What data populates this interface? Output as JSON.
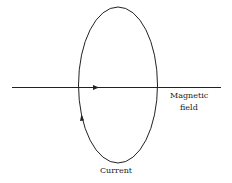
{
  "diagram": {
    "labels": {
      "magnetic_field_line1": "Magnetic",
      "magnetic_field_line2": "field",
      "current": "Current"
    },
    "colors": {
      "stroke": "#222222",
      "background": "#ffffff"
    }
  }
}
